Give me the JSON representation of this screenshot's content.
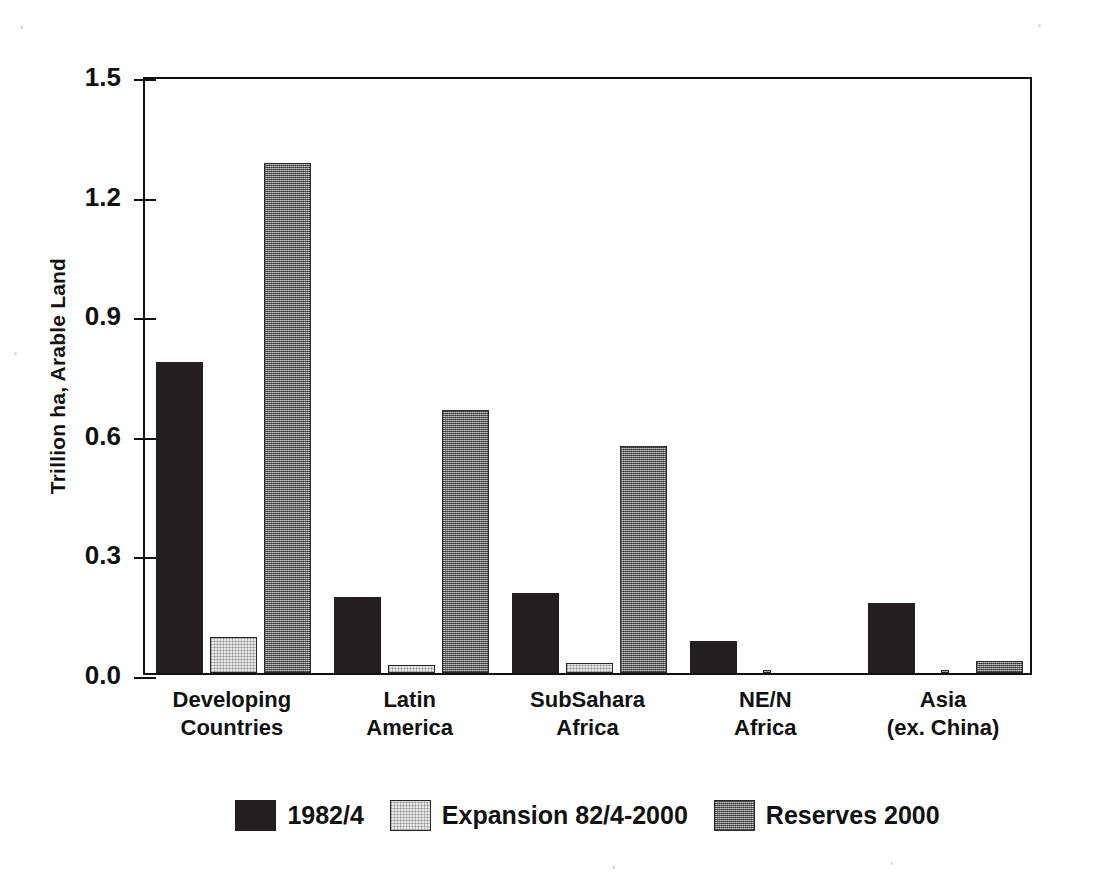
{
  "chart_data": {
    "type": "bar",
    "title": "",
    "xlabel": "",
    "ylabel": "Trillion ha, Arable Land",
    "ylim": [
      0.0,
      1.5
    ],
    "yticks": [
      "0.0",
      "0.3",
      "0.6",
      "0.9",
      "1.2",
      "1.5"
    ],
    "ytick_values": [
      0.0,
      0.3,
      0.6,
      0.9,
      1.2,
      1.5
    ],
    "grid": false,
    "legend_position": "bottom-center",
    "categories": [
      "Developing\nCountries",
      "Latin\nAmerica",
      "SubSahara\nAfrica",
      "NE/N\nAfrica",
      "Asia\n(ex. China)"
    ],
    "category_lines": [
      [
        "Developing",
        "Countries"
      ],
      [
        "Latin",
        "America"
      ],
      [
        "SubSahara",
        "Africa"
      ],
      [
        "NE/N",
        "Africa"
      ],
      [
        "Asia",
        "(ex. China)"
      ]
    ],
    "series": [
      {
        "name": "1982/4",
        "fill": "solid-black",
        "color": "#231f20",
        "values": [
          0.78,
          0.19,
          0.2,
          0.08,
          0.175
        ]
      },
      {
        "name": "Expansion 82/4-2000",
        "fill": "white",
        "color": "#e9e9e9",
        "values": [
          0.09,
          0.02,
          0.025,
          0.003,
          0.005
        ]
      },
      {
        "name": "Reserves 2000",
        "fill": "gray-hatch",
        "color": "#8b8b8b",
        "values": [
          1.28,
          0.66,
          0.57,
          0.0,
          0.03
        ]
      }
    ]
  },
  "legend": {
    "items": [
      {
        "label": "1982/4",
        "swatch": "swatch-dark"
      },
      {
        "label": "Expansion 82/4-2000",
        "swatch": "swatch-white"
      },
      {
        "label": "Reserves 2000",
        "swatch": "swatch-gray"
      }
    ]
  },
  "colors": {
    "axis": "#111111",
    "background": "#ffffff",
    "series_1982": "#231f20",
    "series_expansion": "#e9e9e9",
    "series_reserves": "#8b8b8b"
  }
}
